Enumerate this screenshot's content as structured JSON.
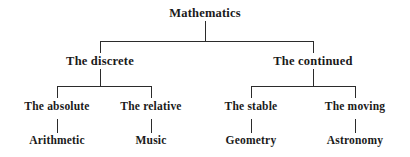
{
  "diagram": {
    "type": "tree",
    "background_color": "#ffffff",
    "line_color": "#2b2b2b",
    "text_color": "#1a1a1a",
    "nodes": {
      "root": "Mathematics",
      "branch_left": "The discrete",
      "branch_right": "The continued",
      "sub_left_1": "The absolute",
      "sub_left_2": "The relative",
      "sub_right_1": "The stable",
      "sub_right_2": "The moving",
      "leaf_1": "Arithmetic",
      "leaf_2": "Music",
      "leaf_3": "Geometry",
      "leaf_4": "Astronomy"
    },
    "edges": [
      {
        "from": "Mathematics",
        "to": "The discrete"
      },
      {
        "from": "Mathematics",
        "to": "The continued"
      },
      {
        "from": "The discrete",
        "to": "The absolute"
      },
      {
        "from": "The discrete",
        "to": "The relative"
      },
      {
        "from": "The continued",
        "to": "The stable"
      },
      {
        "from": "The continued",
        "to": "The moving"
      },
      {
        "from": "The absolute",
        "to": "Arithmetic"
      },
      {
        "from": "The relative",
        "to": "Music"
      },
      {
        "from": "The stable",
        "to": "Geometry"
      },
      {
        "from": "The moving",
        "to": "Astronomy"
      }
    ]
  }
}
